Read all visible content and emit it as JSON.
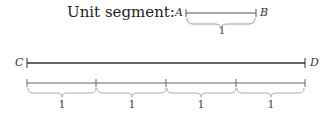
{
  "unit": {
    "title": "Unit segment:",
    "start_label": "A",
    "end_label": "B",
    "length_label": "1"
  },
  "main": {
    "start_label": "C",
    "end_label": "D"
  },
  "divisions": [
    {
      "label": "1"
    },
    {
      "label": "1"
    },
    {
      "label": "1"
    },
    {
      "label": "1"
    }
  ]
}
